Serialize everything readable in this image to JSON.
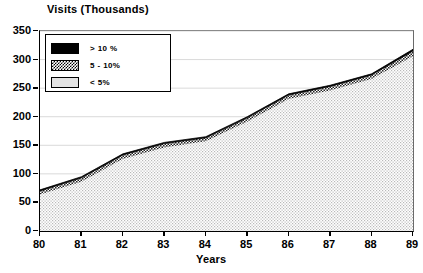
{
  "chart_data": {
    "type": "area",
    "title": "Visits (Thousands)",
    "xlabel": "Years",
    "ylabel": "Visits (Thousands)",
    "categories": [
      "80",
      "81",
      "82",
      "83",
      "84",
      "85",
      "86",
      "87",
      "88",
      "89"
    ],
    "x": [
      80,
      81,
      82,
      83,
      84,
      85,
      86,
      87,
      88,
      89
    ],
    "xlim": [
      80,
      89
    ],
    "ylim": [
      0,
      350
    ],
    "yticks": [
      0,
      50,
      100,
      150,
      200,
      250,
      300,
      350
    ],
    "ytick_labels": [
      "0",
      "50",
      "100",
      "150",
      "200",
      "250",
      "300",
      "350"
    ],
    "grid": true,
    "legend_position": "top-left",
    "series": [
      {
        "name": "< 5%",
        "fill": "light-gray",
        "values": [
          64,
          86,
          126,
          146,
          157,
          191,
          231,
          246,
          266,
          306
        ]
      },
      {
        "name": "5 - 10%",
        "fill": "hatched",
        "values": [
          70,
          93,
          133,
          153,
          163,
          198,
          238,
          253,
          273,
          315
        ]
      },
      {
        "name": "> 10 %",
        "fill": "black",
        "values": [
          72,
          95,
          135,
          155,
          165,
          200,
          240,
          255,
          275,
          318
        ]
      }
    ],
    "total_top_values": [
      72,
      95,
      135,
      155,
      165,
      200,
      240,
      255,
      275,
      318
    ],
    "legend": [
      {
        "label": "> 10 %",
        "swatch": "black"
      },
      {
        "label": "5 - 10%",
        "swatch": "hatched"
      },
      {
        "label": "< 5%",
        "swatch": "light"
      }
    ]
  },
  "colors": {
    "axis": "#000000",
    "grid": "#c9c9c9",
    "band_top_black": "#000000",
    "band_mid_hatch": "#6e6e6e",
    "band_base_light": "#e3e3e3",
    "background": "#ffffff"
  }
}
